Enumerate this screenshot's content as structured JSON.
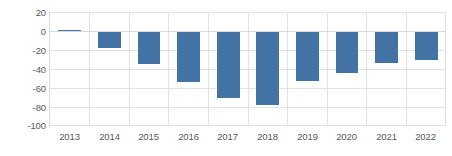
{
  "chart_data": {
    "type": "bar",
    "title": "",
    "subtitle": "",
    "xlabel": "",
    "ylabel": "",
    "categories": [
      "2013",
      "2014",
      "2015",
      "2016",
      "2017",
      "2018",
      "2019",
      "2020",
      "2021",
      "2022"
    ],
    "values": [
      1,
      -18,
      -35,
      -54,
      -71,
      -78,
      -53,
      -44,
      -34,
      -31
    ],
    "series": [
      {
        "name": "",
        "values": [
          1,
          -18,
          -35,
          -54,
          -71,
          -78,
          -53,
          -44,
          -34,
          -31
        ],
        "color": "#4372A5"
      }
    ],
    "ylim": [
      -100,
      20
    ],
    "yticks": [
      20,
      0,
      -20,
      -40,
      -60,
      -80,
      -100
    ],
    "ytick_labels": [
      "20",
      "0",
      "-20",
      "-40",
      "-60",
      "-80",
      "-100"
    ],
    "xtick_labels": [
      "2013",
      "2014",
      "2015",
      "2016",
      "2017",
      "2018",
      "2019",
      "2020",
      "2021",
      "2022"
    ],
    "grid": true,
    "grid_color": "#E2E2E2",
    "legend": false,
    "legend_position": "none",
    "zero_line": 0,
    "background": "#FFFFFF",
    "tick_text_color": "#58595B"
  }
}
